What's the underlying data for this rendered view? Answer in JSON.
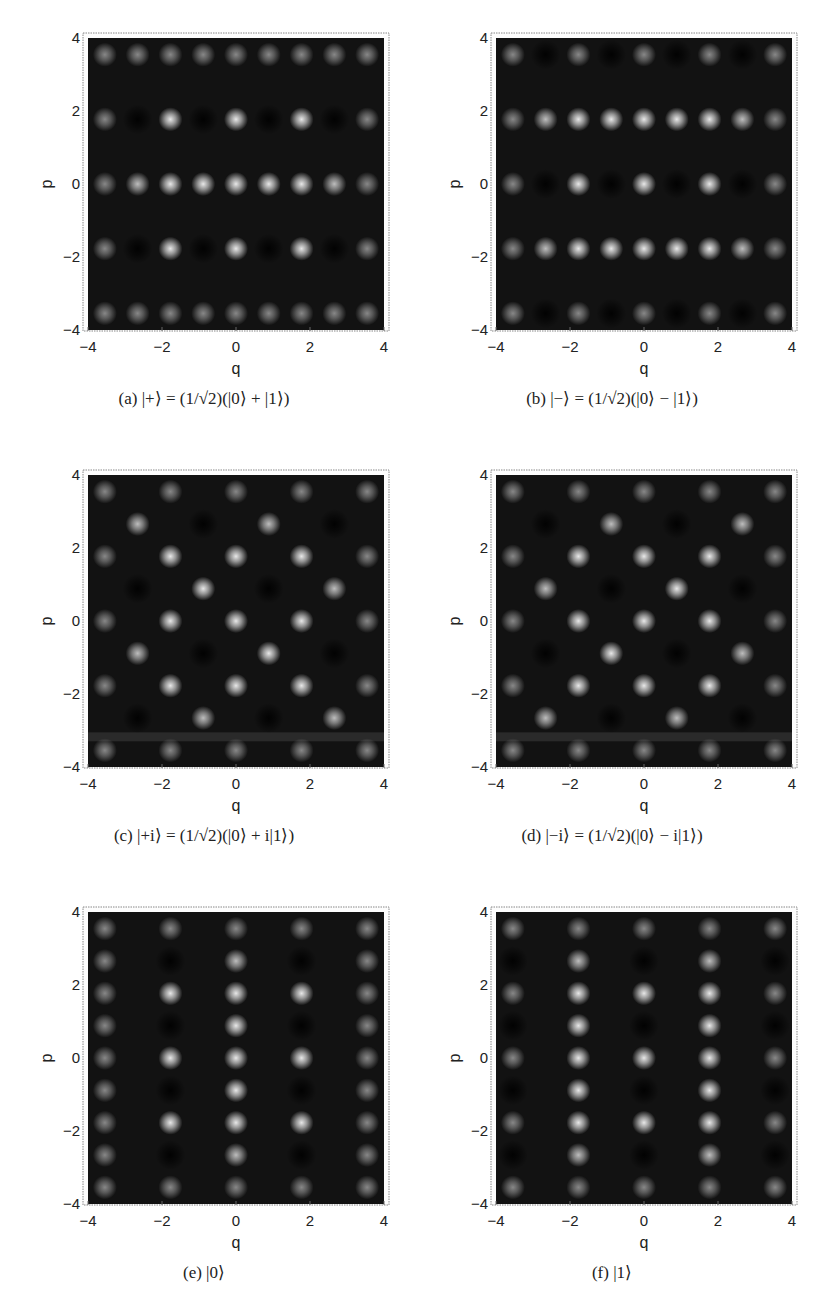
{
  "figure": {
    "panels": [
      {
        "id": "a",
        "caption": "(a) |+⟩ = (1/√2)(|0⟩ + |1⟩)",
        "label": "(a)",
        "state": "|+⟩",
        "formula": "= 1/√2 (|0⟩ + |1⟩)"
      },
      {
        "id": "b",
        "caption": "(b) |−⟩ = (1/√2)(|0⟩ − |1⟩)",
        "label": "(b)",
        "state": "|−⟩",
        "formula": "= 1/√2 (|0⟩ − |1⟩)"
      },
      {
        "id": "c",
        "caption": "(c) |+i⟩ = (1/√2)(|0⟩ + i|1⟩)",
        "label": "(c)",
        "state": "|+i⟩",
        "formula": "= 1/√2 (|0⟩ + i|1⟩)"
      },
      {
        "id": "d",
        "caption": "(d) |−i⟩ = (1/√2)(|0⟩ − i|1⟩)",
        "label": "(d)",
        "state": "|−i⟩",
        "formula": "= 1/√2 (|0⟩ − i|1⟩)"
      },
      {
        "id": "e",
        "caption": "(e) |0⟩",
        "label": "(e)",
        "state": "|0⟩",
        "formula": ""
      },
      {
        "id": "f",
        "caption": "(f) |1⟩",
        "label": "(f)",
        "state": "|1⟩",
        "formula": ""
      }
    ]
  },
  "chart_data": [
    {
      "type": "heatmap",
      "title": "(a) |+⟩ = (1/√2)(|0⟩ + |1⟩)",
      "xlabel": "q",
      "ylabel": "p",
      "xlim": [
        -4,
        4
      ],
      "ylim": [
        -4,
        4
      ],
      "xticks": [
        -4,
        -2,
        0,
        2,
        4
      ],
      "yticks": [
        -4,
        -2,
        0,
        2,
        4
      ],
      "grid": false,
      "colormap": "grayscale (dark = negative, bright = positive)",
      "lattice_spacing": 0.886
    },
    {
      "type": "heatmap",
      "title": "(b) |−⟩ = (1/√2)(|0⟩ − |1⟩)",
      "xlabel": "q",
      "ylabel": "p",
      "xlim": [
        -4,
        4
      ],
      "ylim": [
        -4,
        4
      ],
      "xticks": [
        -4,
        -2,
        0,
        2,
        4
      ],
      "yticks": [
        -4,
        -2,
        0,
        2,
        4
      ],
      "grid": false,
      "colormap": "grayscale (dark = negative, bright = positive)",
      "lattice_spacing": 0.886
    },
    {
      "type": "heatmap",
      "title": "(c) |+i⟩ = (1/√2)(|0⟩ + i|1⟩)",
      "xlabel": "q",
      "ylabel": "p",
      "xlim": [
        -4,
        4
      ],
      "ylim": [
        -4,
        4
      ],
      "xticks": [
        -4,
        -2,
        0,
        2,
        4
      ],
      "yticks": [
        -4,
        -2,
        0,
        2,
        4
      ],
      "grid": false,
      "colormap": "grayscale (dark = negative, bright = positive)",
      "lattice_spacing": 0.886
    },
    {
      "type": "heatmap",
      "title": "(d) |−i⟩ = (1/√2)(|0⟩ − i|1⟩)",
      "xlabel": "q",
      "ylabel": "p",
      "xlim": [
        -4,
        4
      ],
      "ylim": [
        -4,
        4
      ],
      "xticks": [
        -4,
        -2,
        0,
        2,
        4
      ],
      "yticks": [
        -4,
        -2,
        0,
        2,
        4
      ],
      "grid": false,
      "colormap": "grayscale (dark = negative, bright = positive)",
      "lattice_spacing": 0.886
    },
    {
      "type": "heatmap",
      "title": "(e) |0⟩",
      "xlabel": "q",
      "ylabel": "p",
      "xlim": [
        -4,
        4
      ],
      "ylim": [
        -4,
        4
      ],
      "xticks": [
        -4,
        -2,
        0,
        2,
        4
      ],
      "yticks": [
        -4,
        -2,
        0,
        2,
        4
      ],
      "grid": false,
      "colormap": "grayscale (dark = negative, bright = positive)",
      "lattice_spacing": 0.886
    },
    {
      "type": "heatmap",
      "title": "(f) |1⟩",
      "xlabel": "q",
      "ylabel": "p",
      "xlim": [
        -4,
        4
      ],
      "ylim": [
        -4,
        4
      ],
      "xticks": [
        -4,
        -2,
        0,
        2,
        4
      ],
      "yticks": [
        -4,
        -2,
        0,
        2,
        4
      ],
      "grid": false,
      "colormap": "grayscale (dark = negative, bright = positive)",
      "lattice_spacing": 0.886
    }
  ],
  "axes": {
    "xlabel": "q",
    "ylabel": "p",
    "xticks": [
      "−4",
      "−2",
      "0",
      "2",
      "4"
    ],
    "yticks": [
      "4",
      "2",
      "0",
      "−2",
      "−4"
    ]
  },
  "colors": {
    "plot_bg": "#121212",
    "frame": "#888888",
    "peak_bright": "#e8e8e8",
    "peak_dark": "#000000"
  }
}
